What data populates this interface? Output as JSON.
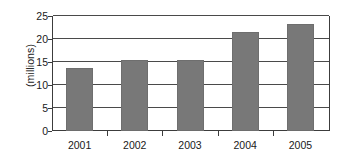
{
  "chart_data": {
    "type": "bar",
    "title": "",
    "xlabel": "",
    "ylabel": "(millions)",
    "categories": [
      "2001",
      "2002",
      "2003",
      "2004",
      "2005"
    ],
    "values": [
      13.7,
      15.4,
      15.4,
      21.5,
      23.3
    ],
    "ylim": [
      0,
      25
    ],
    "yticks": [
      0,
      5,
      10,
      15,
      20,
      25
    ],
    "ytick_labels": [
      "0",
      "5",
      "10",
      "15",
      "20",
      "25"
    ],
    "grid": true,
    "legend": null,
    "series": [
      {
        "name": "",
        "values": [
          13.7,
          15.4,
          15.4,
          21.5,
          23.3
        ]
      }
    ],
    "colors": {
      "bar_fill": "#787878",
      "bar_border": "#6e6e6e",
      "axis": "#3c3c3c",
      "gridline": "#4a4a4a",
      "text": "#1a1a1a",
      "background": "#ffffff"
    }
  }
}
